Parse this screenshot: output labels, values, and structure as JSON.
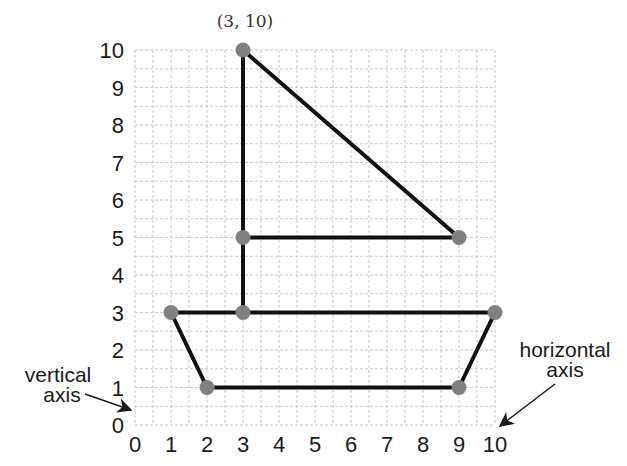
{
  "header": {
    "partial_title": "...ngs"
  },
  "chart_data": {
    "type": "line",
    "title": "",
    "xlabel": "horizontal axis",
    "ylabel": "vertical axis",
    "xlim": [
      0,
      10
    ],
    "ylim": [
      0,
      10
    ],
    "grid": true,
    "x_ticks": [
      "0",
      "1",
      "2",
      "3",
      "4",
      "5",
      "6",
      "7",
      "8",
      "9",
      "10"
    ],
    "y_ticks": [
      "0",
      "1",
      "2",
      "3",
      "4",
      "5",
      "6",
      "7",
      "8",
      "9",
      "10"
    ],
    "points": [
      {
        "x": 3,
        "y": 10
      },
      {
        "x": 3,
        "y": 5
      },
      {
        "x": 9,
        "y": 5
      },
      {
        "x": 3,
        "y": 3
      },
      {
        "x": 1,
        "y": 3
      },
      {
        "x": 10,
        "y": 3
      },
      {
        "x": 2,
        "y": 1
      },
      {
        "x": 9,
        "y": 1
      }
    ],
    "segments": [
      {
        "from": [
          3,
          10
        ],
        "to": [
          3,
          3
        ]
      },
      {
        "from": [
          3,
          10
        ],
        "to": [
          9,
          5
        ]
      },
      {
        "from": [
          3,
          5
        ],
        "to": [
          9,
          5
        ]
      },
      {
        "from": [
          1,
          3
        ],
        "to": [
          10,
          3
        ]
      },
      {
        "from": [
          1,
          3
        ],
        "to": [
          2,
          1
        ]
      },
      {
        "from": [
          2,
          1
        ],
        "to": [
          9,
          1
        ]
      },
      {
        "from": [
          9,
          1
        ],
        "to": [
          10,
          3
        ]
      }
    ],
    "annotations": [
      {
        "text": "(3, 10)",
        "at": [
          3,
          10
        ]
      },
      {
        "text": "vertical axis",
        "points_to": "y-axis"
      },
      {
        "text": "horizontal axis",
        "points_to": "x-axis"
      }
    ]
  },
  "labels": {
    "point_label": "(3, 10)",
    "vertical_axis_line1": "vertical",
    "vertical_axis_line2": "axis",
    "horizontal_axis_line1": "horizontal",
    "horizontal_axis_line2": "axis"
  }
}
